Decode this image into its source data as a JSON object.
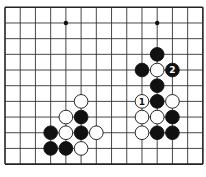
{
  "diagram": {
    "type": "go-board-fragment",
    "grid": {
      "columns": 14,
      "rows": 11,
      "origin_x": 5,
      "origin_y": 7.3,
      "spacing_x": 15.22,
      "spacing_y": 15.68,
      "edges": {
        "top": true,
        "bottom": true,
        "left": true,
        "right": true
      }
    },
    "colors": {
      "line": "#333333",
      "edge": "#222222",
      "black_stone": "#111111",
      "white_stone": "#ffffff",
      "background": "#ffffff"
    },
    "hoshi": [
      {
        "col": 4,
        "row": 1
      },
      {
        "col": 10,
        "row": 1
      }
    ],
    "stones": [
      {
        "color": "black",
        "col": 10,
        "row": 3,
        "label": ""
      },
      {
        "color": "black",
        "col": 9,
        "row": 4,
        "label": ""
      },
      {
        "color": "white",
        "col": 10,
        "row": 4,
        "label": ""
      },
      {
        "color": "black",
        "col": 11,
        "row": 4,
        "label": "2"
      },
      {
        "color": "black",
        "col": 10,
        "row": 5,
        "label": ""
      },
      {
        "color": "white",
        "col": 9,
        "row": 6,
        "label": "1"
      },
      {
        "color": "black",
        "col": 10,
        "row": 6,
        "label": ""
      },
      {
        "color": "white",
        "col": 11,
        "row": 6,
        "label": ""
      },
      {
        "color": "white",
        "col": 9,
        "row": 7,
        "label": ""
      },
      {
        "color": "white",
        "col": 10,
        "row": 7,
        "label": ""
      },
      {
        "color": "black",
        "col": 11,
        "row": 7,
        "label": ""
      },
      {
        "color": "white",
        "col": 9,
        "row": 8,
        "label": ""
      },
      {
        "color": "black",
        "col": 10,
        "row": 8,
        "label": ""
      },
      {
        "color": "black",
        "col": 11,
        "row": 8,
        "label": ""
      },
      {
        "color": "white",
        "col": 5,
        "row": 6,
        "label": ""
      },
      {
        "color": "white",
        "col": 4,
        "row": 7,
        "label": ""
      },
      {
        "color": "black",
        "col": 5,
        "row": 7,
        "label": ""
      },
      {
        "color": "black",
        "col": 3,
        "row": 8,
        "label": ""
      },
      {
        "color": "white",
        "col": 4,
        "row": 8,
        "label": ""
      },
      {
        "color": "black",
        "col": 5,
        "row": 8,
        "label": ""
      },
      {
        "color": "white",
        "col": 6,
        "row": 8,
        "label": ""
      },
      {
        "color": "black",
        "col": 3,
        "row": 9,
        "label": ""
      },
      {
        "color": "black",
        "col": 4,
        "row": 9,
        "label": ""
      },
      {
        "color": "white",
        "col": 5,
        "row": 9,
        "label": ""
      }
    ]
  }
}
